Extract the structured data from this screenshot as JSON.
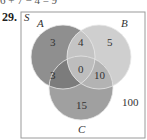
{
  "top_fragment": "6 + 7 − 4 = 9",
  "problem_number": "29.",
  "diagram": {
    "universe_label": "S",
    "sets": [
      {
        "name": "A",
        "color": "#8f8f8f"
      },
      {
        "name": "B",
        "color": "#c9c9c9"
      },
      {
        "name": "C",
        "color": "#a3a3a3"
      }
    ],
    "regions": {
      "A_only": "3",
      "A_and_B_only": "4",
      "B_only": "5",
      "A_and_B_and_C": "0",
      "A_and_C_only": "3",
      "B_and_C_only": "10",
      "C_only": "15",
      "outside": "100"
    }
  }
}
